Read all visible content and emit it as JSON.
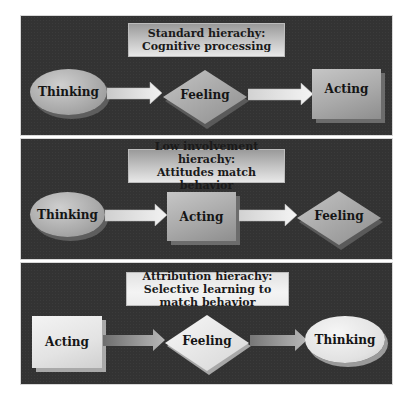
{
  "panels": [
    {
      "title_line1": "Standard hierachy:",
      "title_line2": "Cognitive processing",
      "nodes": [
        "Thinking",
        "Feeling",
        "Acting"
      ],
      "shapes": [
        "ellipse",
        "diamond",
        "box"
      ]
    },
    {
      "title_line1": "Low involvement hierachy:",
      "title_line2": "Attitudes match behavior",
      "nodes": [
        "Thinking",
        "Acting",
        "Feeling"
      ],
      "shapes": [
        "ellipse",
        "box",
        "diamond"
      ]
    },
    {
      "title_line1": "Attribution hierachy:",
      "title_line2": "Selective learning to match behavior",
      "nodes": [
        "Acting",
        "Feeling",
        "Thinking"
      ],
      "shapes": [
        "box",
        "diamond",
        "ellipse"
      ]
    }
  ],
  "colors": {
    "panel_background": "#333333",
    "shape_gray": "#a9a9a9",
    "shape_light": "#e6e6e6",
    "page_background": "#ffffff"
  }
}
